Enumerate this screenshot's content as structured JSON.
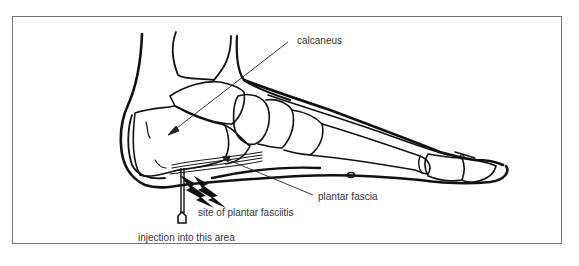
{
  "figure": {
    "labels": {
      "calcaneus": "calcaneus",
      "plantar_fascia": "plantar fascia",
      "site": "site of plantar fasciitis",
      "injection": "injection into this area"
    }
  }
}
